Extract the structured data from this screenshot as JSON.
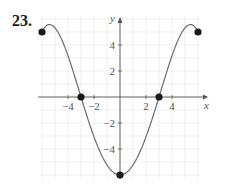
{
  "problem": {
    "number": "23."
  },
  "chart_data": {
    "type": "line",
    "title": "",
    "xlabel": "x",
    "ylabel": "y",
    "xlim": [
      -6,
      6
    ],
    "ylim": [
      -6,
      5
    ],
    "grid": true,
    "x_ticks": [
      -4,
      -2,
      2,
      4
    ],
    "x_tick_labels": [
      "−4",
      "−2",
      "2",
      "4"
    ],
    "y_ticks": [
      4,
      2,
      -2,
      -4
    ],
    "y_tick_labels": [
      "4",
      "2",
      "−2",
      "−4"
    ],
    "series": [
      {
        "name": "f(x)",
        "description": "Smooth even curve: starts at (-6, 5), decreases through (-3, 0) to minimum (0, -6), increases through (3, 0) to (6, 5)",
        "marked_points": [
          {
            "x": -6,
            "y": 5
          },
          {
            "x": -3,
            "y": 0
          },
          {
            "x": 0,
            "y": -6
          },
          {
            "x": 3,
            "y": 0
          },
          {
            "x": 6,
            "y": 5
          }
        ]
      }
    ],
    "colors": {
      "curve": "#6e6e6e",
      "points": "#1a1a1a",
      "axis": "#555555",
      "grid": "#e6e6e6"
    }
  }
}
